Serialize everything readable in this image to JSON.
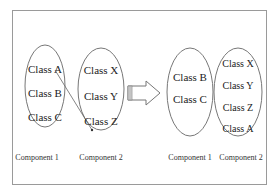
{
  "diagram": {
    "before": {
      "component1": {
        "label": "Component 1",
        "classes": [
          "Class A",
          "Class B",
          "Class C"
        ]
      },
      "component2": {
        "label": "Component 2",
        "classes": [
          "Class X",
          "Class Y",
          "Class Z"
        ]
      },
      "move_arrow": {
        "from": "Class A",
        "to": "Component 2"
      }
    },
    "transition_arrow": "block-right-arrow",
    "after": {
      "component1": {
        "label": "Component 1",
        "classes": [
          "Class B",
          "Class C"
        ]
      },
      "component2": {
        "label": "Component 2",
        "classes": [
          "Class X",
          "Class Y",
          "Class Z",
          "Class A"
        ]
      }
    },
    "colors": {
      "stroke": "#777777",
      "frame": "#9a9a9a",
      "text": "#222222"
    }
  }
}
